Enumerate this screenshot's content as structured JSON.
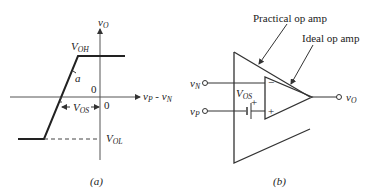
{
  "panel_a": {
    "caption": "(a)",
    "y_axis_label": {
      "main": "v",
      "sub": "O"
    },
    "x_axis_label": {
      "main": "v",
      "sub1": "P",
      "mid": " - v",
      "sub2": "N"
    },
    "voh_label": {
      "main": "V",
      "sub": "OH"
    },
    "vol_label": {
      "main": "V",
      "sub": "OL"
    },
    "vos_label": {
      "main": "V",
      "sub": "OS"
    },
    "slope_label": "a",
    "origin_label_upper": "0",
    "origin_label_lower": "0"
  },
  "panel_b": {
    "caption": "(b)",
    "practical_label": "Practical op amp",
    "ideal_label": "Ideal op amp",
    "vn_label": {
      "main": "v",
      "sub": "N"
    },
    "vp_label": {
      "main": "v",
      "sub": "P"
    },
    "vo_label": {
      "main": "v",
      "sub": "O"
    },
    "vos_label": {
      "main": "V",
      "sub": "OS"
    },
    "minus_sign": "−",
    "plus_sign": "+",
    "battery_plus": "+"
  },
  "colors": {
    "stroke": "#333333",
    "text": "#222222"
  }
}
